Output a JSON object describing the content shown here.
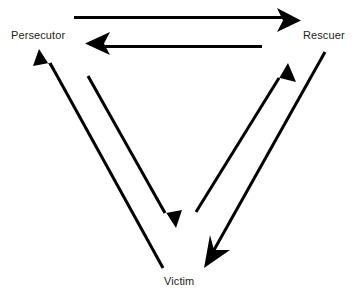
{
  "diagram": {
    "type": "cycle-diagram",
    "background_color": "#ffffff",
    "stroke_color": "#000000",
    "text_color": "#231f20",
    "nodes": [
      {
        "id": "persecutor",
        "label": "Persecutor",
        "position": "top-left"
      },
      {
        "id": "rescuer",
        "label": "Rescuer",
        "position": "top-right"
      },
      {
        "id": "victim",
        "label": "Victim",
        "position": "bottom-center"
      }
    ],
    "edges": [
      {
        "id": "persecutor-to-rescuer",
        "from": "Persecutor",
        "to": "Rescuer",
        "arrowhead": "end",
        "orientation": "horizontal-top"
      },
      {
        "id": "rescuer-to-persecutor",
        "from": "Rescuer",
        "to": "Persecutor",
        "arrowhead": "end",
        "orientation": "horizontal-top"
      },
      {
        "id": "persecutor-to-victim",
        "from": "Persecutor",
        "to": "Victim",
        "arrowhead": "end",
        "orientation": "diagonal-left-down"
      },
      {
        "id": "victim-to-persecutor",
        "from": "Victim",
        "to": "Persecutor",
        "arrowhead": "end",
        "orientation": "diagonal-left-up"
      },
      {
        "id": "rescuer-to-victim",
        "from": "Rescuer",
        "to": "Victim",
        "arrowhead": "end",
        "orientation": "diagonal-right-down"
      },
      {
        "id": "victim-to-rescuer",
        "from": "Victim",
        "to": "Rescuer",
        "arrowhead": "end",
        "orientation": "diagonal-right-up"
      }
    ]
  }
}
